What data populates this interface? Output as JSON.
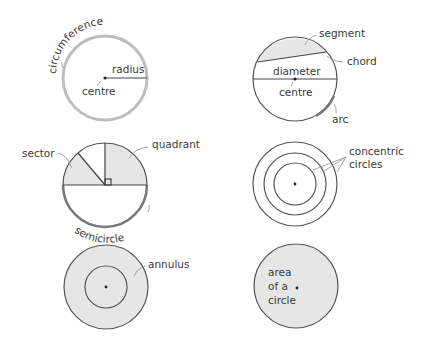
{
  "diagram": {
    "colors": {
      "background": "#ffffff",
      "outline": "#555555",
      "shade": "#e6e6e6",
      "circumference_highlight": "#bdbdbd",
      "text": "#3a3a3a",
      "pointer": "#9a9a9a"
    },
    "panels": [
      {
        "id": "circumference",
        "labels": {
          "circumference": "circumference",
          "radius": "radius",
          "centre": "centre"
        }
      },
      {
        "id": "chord",
        "labels": {
          "segment": "segment",
          "chord": "chord",
          "diameter": "diameter",
          "centre": "centre",
          "arc": "arc"
        }
      },
      {
        "id": "sector",
        "labels": {
          "sector": "sector",
          "quadrant": "quadrant",
          "semicircle": "semicircle"
        }
      },
      {
        "id": "concentric",
        "labels": {
          "line1": "concentric",
          "line2": "circles"
        }
      },
      {
        "id": "annulus",
        "labels": {
          "annulus": "annulus"
        }
      },
      {
        "id": "area",
        "labels": {
          "line1": "area",
          "line2": "of a",
          "line3": "circle"
        }
      }
    ]
  }
}
